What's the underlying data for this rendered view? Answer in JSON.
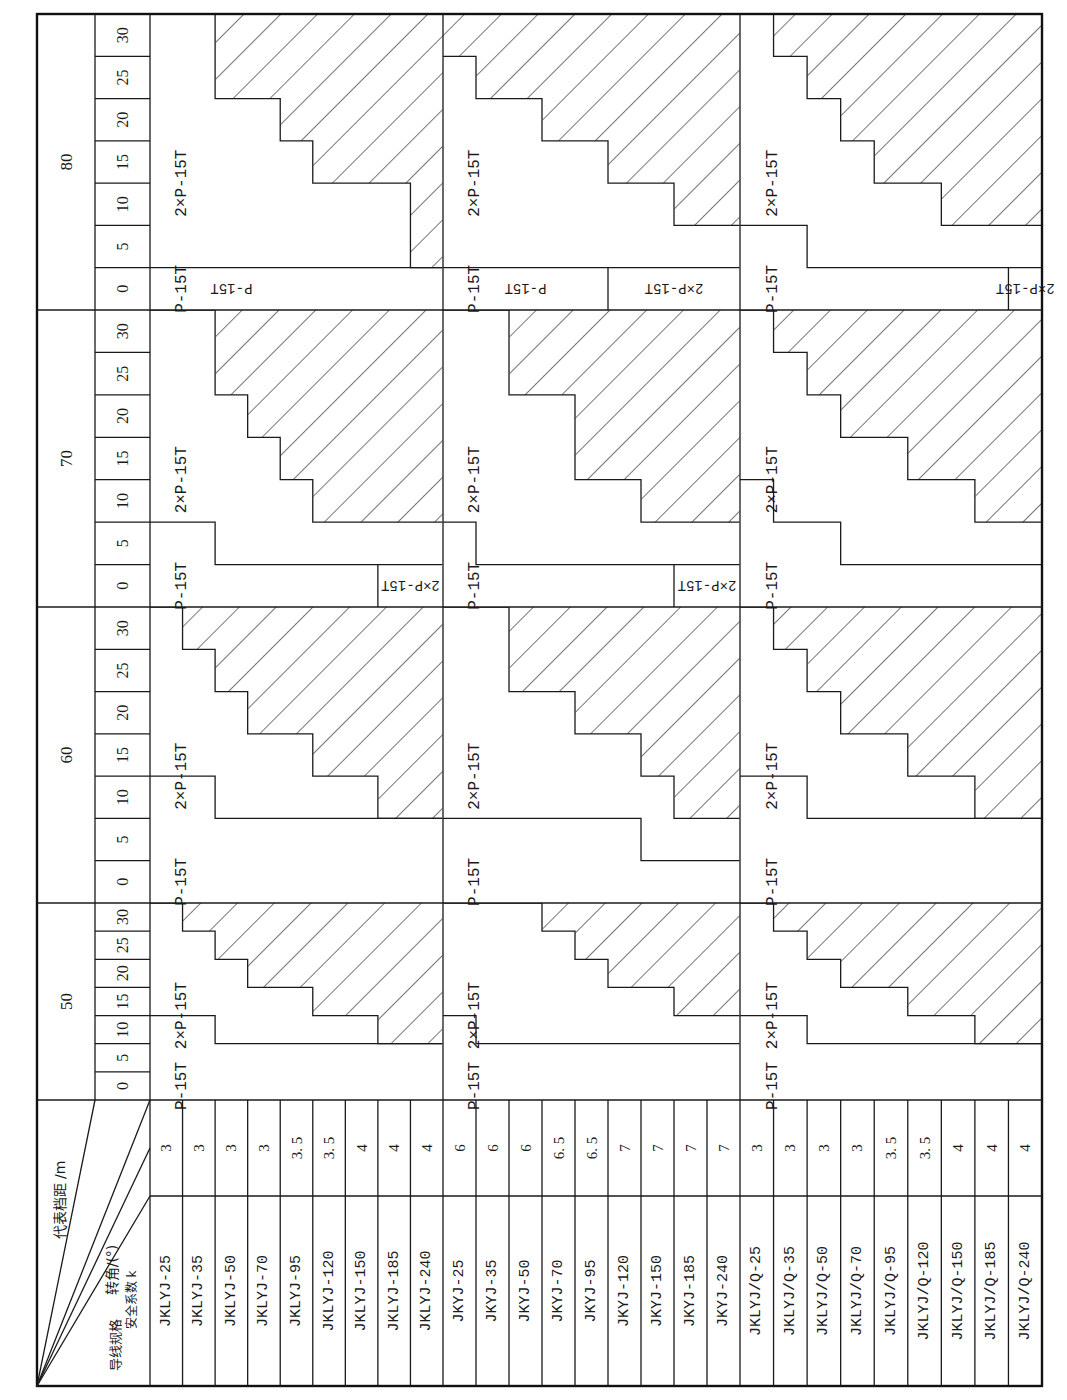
{
  "table": {
    "corner_header": {
      "span_label": "代表档距 /m",
      "angle_label": "转角/(°)",
      "k_label": "安全系数 k",
      "spec_label": "导线规格"
    },
    "angles": [
      "0",
      "5",
      "10",
      "15",
      "20",
      "25",
      "30"
    ],
    "spans": [
      "50",
      "60",
      "70",
      "80"
    ],
    "groups": [
      {
        "name": "JKLYJ",
        "rows": [
          {
            "spec": "JKLYJ-25",
            "k": "3"
          },
          {
            "spec": "JKLYJ-35",
            "k": "3"
          },
          {
            "spec": "JKLYJ-50",
            "k": "3"
          },
          {
            "spec": "JKLYJ-70",
            "k": "3"
          },
          {
            "spec": "JKLYJ-95",
            "k": "3. 5"
          },
          {
            "spec": "JKLYJ-120",
            "k": "3. 5"
          },
          {
            "spec": "JKLYJ-150",
            "k": "4"
          },
          {
            "spec": "JKLYJ-185",
            "k": "4"
          },
          {
            "spec": "JKLYJ-240",
            "k": "4"
          }
        ]
      },
      {
        "name": "JKYJ",
        "rows": [
          {
            "spec": "JKYJ-25",
            "k": "6"
          },
          {
            "spec": "JKYJ-35",
            "k": "6"
          },
          {
            "spec": "JKYJ-50",
            "k": "6"
          },
          {
            "spec": "JKYJ-70",
            "k": "6. 5"
          },
          {
            "spec": "JKYJ-95",
            "k": "6. 5"
          },
          {
            "spec": "JKYJ-120",
            "k": "7"
          },
          {
            "spec": "JKYJ-150",
            "k": "7"
          },
          {
            "spec": "JKYJ-185",
            "k": "7"
          },
          {
            "spec": "JKYJ-240",
            "k": "7"
          }
        ]
      },
      {
        "name": "JKLYJ/Q",
        "rows": [
          {
            "spec": "JKLYJ/Q-25",
            "k": "3"
          },
          {
            "spec": "JKLYJ/Q-35",
            "k": "3"
          },
          {
            "spec": "JKLYJ/Q-50",
            "k": "3"
          },
          {
            "spec": "JKLYJ/Q-70",
            "k": "3"
          },
          {
            "spec": "JKLYJ/Q-95",
            "k": "3. 5"
          },
          {
            "spec": "JKLYJ/Q-120",
            "k": "3. 5"
          },
          {
            "spec": "JKLYJ/Q-150",
            "k": "4"
          },
          {
            "spec": "JKLYJ/Q-185",
            "k": "4"
          },
          {
            "spec": "JKLYJ/Q-240",
            "k": "4"
          }
        ]
      }
    ],
    "region_labels": {
      "single": "P-15T",
      "double": "2×P-15T"
    },
    "cells": [
      {
        "span": "50",
        "group": 0,
        "single_max_angle": [
          10,
          10,
          5,
          5,
          5,
          5,
          5,
          5,
          5
        ],
        "double_max_angle": [
          30,
          25,
          20,
          15,
          15,
          10,
          10,
          5,
          5
        ],
        "label_single": "P-15T",
        "label_double": "2×P-15T"
      },
      {
        "span": "50",
        "group": 1,
        "single_max_angle": [
          10,
          5,
          5,
          5,
          5,
          5,
          5,
          5,
          5
        ],
        "double_max_angle": [
          30,
          30,
          30,
          25,
          20,
          15,
          15,
          10,
          10
        ],
        "label_single": "P-15T",
        "label_double": "2×P-15T"
      },
      {
        "span": "50",
        "group": 2,
        "single_max_angle": [
          10,
          10,
          5,
          5,
          5,
          5,
          5,
          5,
          5
        ],
        "double_max_angle": [
          30,
          25,
          20,
          15,
          15,
          10,
          10,
          5,
          5
        ],
        "label_single": "P-15T",
        "label_double": "2×P-15T"
      },
      {
        "span": "60",
        "group": 0,
        "single_max_angle": [
          10,
          10,
          5,
          5,
          5,
          5,
          5,
          5,
          5
        ],
        "double_max_angle": [
          30,
          25,
          20,
          15,
          15,
          10,
          10,
          5,
          5
        ],
        "label_single": "P-15T",
        "label_double": "2×P-15T"
      },
      {
        "span": "60",
        "group": 1,
        "single_max_angle": [
          5,
          5,
          5,
          5,
          5,
          5,
          0,
          0,
          0
        ],
        "double_max_angle": [
          30,
          30,
          20,
          20,
          15,
          15,
          10,
          5,
          5
        ],
        "label_single": "P-15T",
        "label_double": "2×P-15T"
      },
      {
        "span": "60",
        "group": 2,
        "single_max_angle": [
          10,
          10,
          5,
          5,
          5,
          5,
          5,
          5,
          5
        ],
        "double_max_angle": [
          30,
          25,
          20,
          15,
          15,
          10,
          10,
          5,
          5
        ],
        "label_single": "P-15T",
        "label_double": "2×P-15T"
      },
      {
        "span": "70",
        "group": 0,
        "single_max_angle": [
          5,
          5,
          0,
          0,
          0,
          0,
          0,
          0,
          0
        ],
        "double_max_angle": [
          30,
          30,
          20,
          15,
          10,
          5,
          5,
          5,
          5
        ],
        "label_single": "P-15T",
        "label_double": "2×P-15T",
        "double_at_zero_from_row": 7,
        "label_double_zero": "2×P-15T"
      },
      {
        "span": "70",
        "group": 1,
        "single_max_angle": [
          5,
          0,
          0,
          0,
          0,
          0,
          0,
          0,
          0
        ],
        "double_max_angle": [
          30,
          30,
          20,
          20,
          10,
          10,
          5,
          5,
          5
        ],
        "label_single": "P-15T",
        "label_double": "2×P-15T",
        "double_at_zero_from_row": 7,
        "label_double_zero": "2×P-15T"
      },
      {
        "span": "70",
        "group": 2,
        "single_max_angle": [
          10,
          5,
          5,
          0,
          0,
          0,
          0,
          0,
          0
        ],
        "double_max_angle": [
          30,
          25,
          20,
          15,
          15,
          10,
          10,
          5,
          5
        ],
        "label_single": "P-15T",
        "label_double": "2×P-15T"
      },
      {
        "span": "80",
        "group": 0,
        "single_max_angle": [
          0,
          0,
          0,
          0,
          0,
          0,
          0,
          0,
          0
        ],
        "double_max_angle": [
          30,
          30,
          20,
          20,
          15,
          10,
          10,
          10,
          0
        ],
        "label_single": "P-15T",
        "label_double": "2×P-15T",
        "single_zero_rows": 5,
        "label_single_zero": "P-15T"
      },
      {
        "span": "80",
        "group": 1,
        "single_max_angle": [
          0,
          0,
          0,
          0,
          0,
          0,
          0,
          0,
          0
        ],
        "double_max_angle": [
          25,
          20,
          20,
          15,
          15,
          10,
          10,
          5,
          5
        ],
        "label_single": "P-15T",
        "label_double": "2×P-15T",
        "single_zero_rows": 5,
        "label_single_zero": "P-15T",
        "double_at_zero_from_row": 5,
        "label_double_zero": "2×P-15T"
      },
      {
        "span": "80",
        "group": 2,
        "single_max_angle": [
          5,
          5,
          0,
          0,
          0,
          0,
          0,
          0,
          0
        ],
        "double_max_angle": [
          30,
          25,
          20,
          15,
          10,
          10,
          5,
          5,
          5
        ],
        "label_single": "P-15T",
        "label_double": "2×P-15T",
        "double_at_zero_from_row": 8,
        "label_double_zero": "2×P-15T"
      }
    ]
  }
}
